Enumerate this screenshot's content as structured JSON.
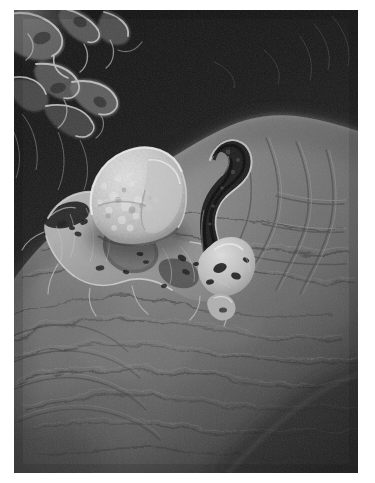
{
  "document": {
    "type": "scanning-electron-micrograph",
    "orientation": "portrait",
    "alt_text": "Black and white scanning electron micrograph of a rounded cell with spreading pseudopodia adhering to a large wrinkled tissue surface, against a dark background.",
    "caption": ""
  },
  "plate": {
    "left": 14,
    "top": 10,
    "width": 344,
    "height": 463,
    "border_color": "#ffffff",
    "page_background": "#ffffff"
  },
  "palette": {
    "paper": "#ffffff",
    "background_dark": "#171717",
    "background_upper_mid": "#2c2c2c",
    "tissue_mid": "#6f6f6f",
    "tissue_light": "#8a8a8a",
    "tissue_shadow": "#3d3d3d",
    "cell_bright": "#c9c9c9",
    "cell_highlight": "#e0e0e0",
    "process_dark": "#1d1d1d",
    "network_light": "#9a9a9a"
  },
  "regions": [
    {
      "name": "dark-background",
      "description": "Near black void occupying the upper portion of the frame",
      "tone": "#171717"
    },
    {
      "name": "fibrous-network",
      "description": "Branching light grey filamentous network in the upper-left corner",
      "tone": "#8f8f8f"
    },
    {
      "name": "tissue-surface",
      "description": "Large domed wrinkled substrate filling the lower two-thirds of the frame",
      "tone": "#6f6f6f"
    },
    {
      "name": "adherent-cell",
      "description": "Bright granular rounded cell body near the centre-left",
      "tone": "#cccccc"
    },
    {
      "name": "pseudopodia",
      "description": "Thin veil-like cytoplasmic extensions radiating from the cell across the substrate",
      "tone": "#a8a8a8"
    },
    {
      "name": "hooked-process",
      "description": "Dark question-mark shaped process curving upward to the right of the cell",
      "tone": "#1f1f1f"
    },
    {
      "name": "lower-right-shadow",
      "description": "Dark shadowed fold running across the lower-right corner",
      "tone": "#2a2a2a"
    }
  ]
}
